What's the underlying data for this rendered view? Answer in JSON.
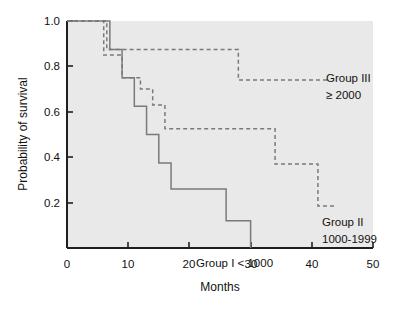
{
  "chart_data": {
    "type": "line",
    "title": "",
    "xlabel": "Months",
    "ylabel": "Probability of survival",
    "xlim": [
      0,
      50
    ],
    "ylim": [
      0,
      1.0
    ],
    "xticks": [
      0,
      10,
      20,
      30,
      40,
      50
    ],
    "xtick_labels": [
      "0",
      "10",
      "20",
      "30",
      "40",
      "50"
    ],
    "yticks": [
      0.2,
      0.4,
      0.6,
      0.8,
      1.0
    ],
    "ytick_labels": [
      "0.2",
      "0.4",
      "0.6",
      "0.8",
      "1.0"
    ],
    "grid": false,
    "legend_position": "inline-annotations",
    "plot_background": "#e8e8e8",
    "line_color": "#7a7a7a",
    "series": [
      {
        "name": "Group I < 1000",
        "style": "solid",
        "label_lines": [
          "Group I < 1000"
        ],
        "x": [
          0,
          7,
          7,
          9,
          9,
          11,
          11,
          12,
          12,
          13,
          13,
          14,
          14,
          15,
          15,
          17,
          17,
          26,
          26,
          30,
          30
        ],
        "y": [
          1.0,
          1.0,
          0.875,
          0.875,
          0.75,
          0.75,
          0.625,
          0.625,
          0.625,
          0.625,
          0.5,
          0.5,
          0.5,
          0.5,
          0.375,
          0.375,
          0.26,
          0.26,
          0.12,
          0.12,
          0.0
        ]
      },
      {
        "name": "Group II 1000-1999",
        "style": "dashed",
        "label_lines": [
          "Group II",
          "1000-1999"
        ],
        "x": [
          0,
          6,
          6,
          9,
          9,
          12,
          12,
          14,
          14,
          16,
          16,
          34,
          34,
          41,
          41,
          44
        ],
        "y": [
          1.0,
          1.0,
          0.85,
          0.85,
          0.75,
          0.75,
          0.7,
          0.7,
          0.63,
          0.63,
          0.525,
          0.525,
          0.37,
          0.37,
          0.185,
          0.185
        ]
      },
      {
        "name": "Group III ≥ 2000",
        "style": "dashed",
        "label_lines": [
          "Group III",
          "≥ 2000"
        ],
        "x": [
          0,
          6.5,
          6.5,
          28,
          28,
          43
        ],
        "y": [
          1.0,
          1.0,
          0.875,
          0.875,
          0.74,
          0.74
        ]
      }
    ],
    "annotations": [
      {
        "key": "group3",
        "text_lines": [
          "Group III",
          "≥ 2000"
        ],
        "x_px": 326,
        "y_px": 78
      },
      {
        "key": "group2",
        "text_lines": [
          "Group II",
          "1000-1999"
        ],
        "x_px": 321,
        "y_px": 222
      },
      {
        "key": "group1",
        "text_lines": [
          "Group I < 1000"
        ],
        "x_px": 196,
        "y_px": 263
      }
    ]
  },
  "axes": {
    "x_title": "Months",
    "y_title": "Probability of survival",
    "x_tick_labels": [
      "0",
      "10",
      "20",
      "30",
      "40",
      "50"
    ],
    "y_tick_labels": [
      "1.0",
      "0.8",
      "0.6",
      "0.4",
      "0.2"
    ]
  },
  "labels": {
    "group3_line1": "Group III",
    "group3_line2": "≥ 2000",
    "group2_line1": "Group II",
    "group2_line2": "1000-1999",
    "group1_line1": "Group I < 1000"
  }
}
